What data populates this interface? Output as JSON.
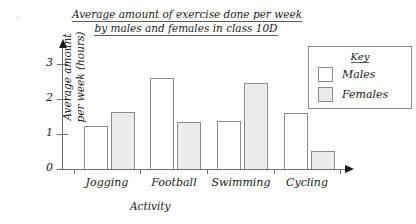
{
  "chart_data": {
    "type": "bar",
    "title": "Average amount of exercise done per week by males and females in class 10D",
    "title_line1": "Average amount of exercise done per week",
    "title_line2": "by males and females in class 10D",
    "xlabel": "Activity",
    "ylabel": "Average amount per week (hours)",
    "ylabel_line1": "Average amount",
    "ylabel_line2": "per week (hours)",
    "categories": [
      "Jogging",
      "Football",
      "Swimming",
      "Cycling"
    ],
    "series": [
      {
        "name": "Males",
        "values": [
          1.2,
          2.55,
          1.35,
          1.55
        ],
        "color": "#ffffff"
      },
      {
        "name": "Females",
        "values": [
          1.6,
          1.3,
          2.4,
          0.5
        ],
        "color": "#ececec"
      }
    ],
    "ylim": [
      0,
      3.4
    ],
    "yticks": [
      0,
      1,
      2,
      3
    ],
    "ytick_labels": [
      "0",
      "1",
      "2",
      "3"
    ],
    "grid": false,
    "legend_position": "top-right"
  },
  "legend": {
    "title": "Key",
    "entries": [
      {
        "label": "Males",
        "swatch": "male"
      },
      {
        "label": "Females",
        "swatch": "female"
      }
    ]
  },
  "colors": {
    "male_fill": "#ffffff",
    "female_fill": "#ececec",
    "bar_stroke": "#8a8a8a",
    "axis": "#6f6f6f",
    "text": "#1a1a1a",
    "background": "#ffffff"
  }
}
